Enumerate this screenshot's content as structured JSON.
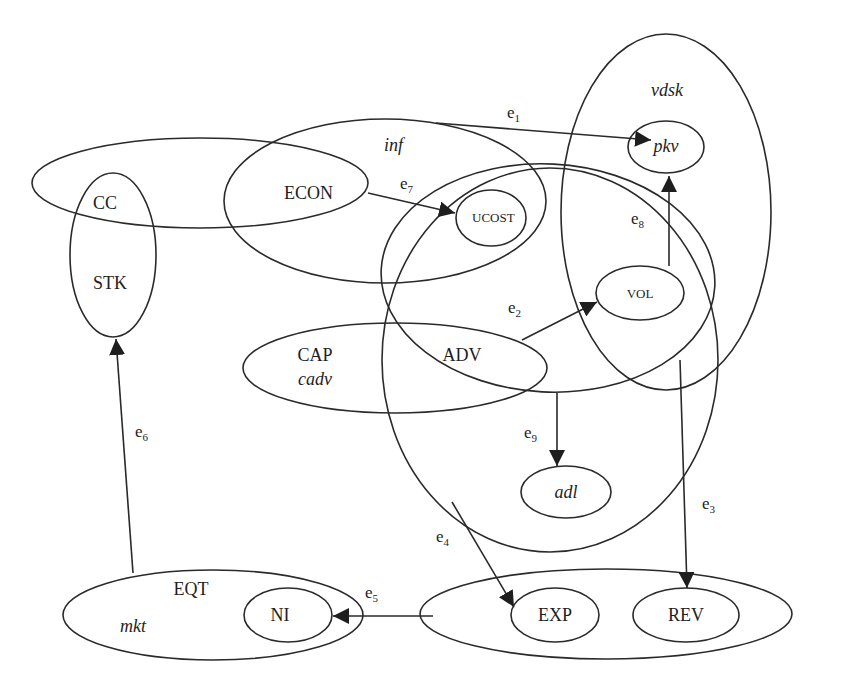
{
  "diagram": {
    "nodes": {
      "cc": "CC",
      "stk": "STK",
      "econ": "ECON",
      "inf": "inf",
      "ucost": "UCOST",
      "pkv": "pkv",
      "vdsk": "vdsk",
      "vol": "VOL",
      "cap": "CAP",
      "cadv": "cadv",
      "adv": "ADV",
      "adl": "adl",
      "eqt": "EQT",
      "mkt": "mkt",
      "ni": "NI",
      "exp": "EXP",
      "rev": "REV"
    },
    "edges": {
      "e1": {
        "base": "e",
        "sub": "1"
      },
      "e2": {
        "base": "e",
        "sub": "2"
      },
      "e3": {
        "base": "e",
        "sub": "3"
      },
      "e4": {
        "base": "e",
        "sub": "4"
      },
      "e5": {
        "base": "e",
        "sub": "5"
      },
      "e6": {
        "base": "e",
        "sub": "6"
      },
      "e7": {
        "base": "e",
        "sub": "7"
      },
      "e8": {
        "base": "e",
        "sub": "8"
      },
      "e9": {
        "base": "e",
        "sub": "9"
      }
    },
    "colors": {
      "stroke": "#2a2a2a",
      "background": "#ffffff"
    }
  }
}
